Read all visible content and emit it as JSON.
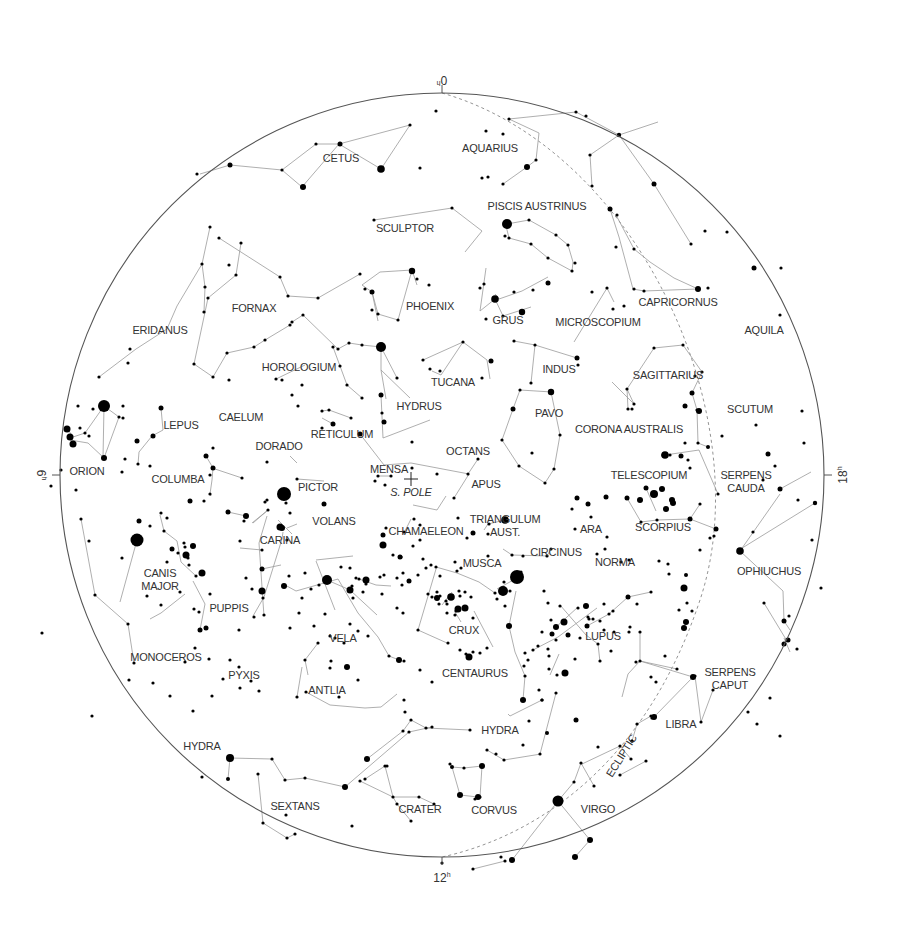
{
  "map": {
    "title": "Southern sky star chart",
    "pole_label": "S. POLE",
    "ecliptic_label": "ECLIPTIC",
    "hour_labels": [
      {
        "name": "hour-0",
        "text": "0",
        "sup": "h",
        "ra": 0
      },
      {
        "name": "hour-6",
        "text": "6",
        "sup": "h",
        "ra": 6
      },
      {
        "name": "hour-12",
        "text": "12",
        "sup": "h",
        "ra": 12
      },
      {
        "name": "hour-18",
        "text": "18",
        "sup": "h",
        "ra": 18
      }
    ],
    "colors": {
      "star": "#000000",
      "lines": "#9a9a9a",
      "text": "#333333",
      "border": "#555555",
      "ecliptic": "#888888"
    },
    "constellations": [
      {
        "name": "CETUS",
        "lines": [
          [
            "CETUS",
            ""
          ]
        ],
        "p": [
          341,
          162
        ]
      },
      {
        "name": "AQUARIUS",
        "lines": [
          [
            "AQUARIUS",
            ""
          ]
        ],
        "p": [
          490,
          152
        ]
      },
      {
        "name": "PISCIS AUSTRINUS",
        "lines": [
          [
            "PISCIS AUSTRINUS",
            ""
          ]
        ],
        "p": [
          537,
          210
        ]
      },
      {
        "name": "SCULPTOR",
        "lines": [
          [
            "SCULPTOR",
            ""
          ]
        ],
        "p": [
          405,
          232
        ]
      },
      {
        "name": "FORNAX",
        "lines": [
          [
            "FORNAX",
            ""
          ]
        ],
        "p": [
          254,
          312
        ]
      },
      {
        "name": "PHOENIX",
        "lines": [
          [
            "PHOENIX",
            ""
          ]
        ],
        "p": [
          430,
          310
        ]
      },
      {
        "name": "GRUS",
        "lines": [
          [
            "GRUS",
            ""
          ]
        ],
        "p": [
          508,
          324
        ]
      },
      {
        "name": "MICROSCOPIUM",
        "lines": [
          [
            "MICROSCOPIUM",
            ""
          ]
        ],
        "p": [
          598,
          326
        ]
      },
      {
        "name": "CAPRICORNUS",
        "lines": [
          [
            "CAPRICORNUS",
            ""
          ]
        ],
        "p": [
          678,
          306
        ]
      },
      {
        "name": "AQUILA",
        "lines": [
          [
            "AQUILA",
            ""
          ]
        ],
        "p": [
          764,
          334
        ]
      },
      {
        "name": "ERIDANUS",
        "lines": [
          [
            "ERIDANUS",
            ""
          ]
        ],
        "p": [
          160,
          334
        ]
      },
      {
        "name": "HOROLOGIUM",
        "lines": [
          [
            "HOROLOGIUM",
            ""
          ]
        ],
        "p": [
          299,
          371
        ]
      },
      {
        "name": "TUCANA",
        "lines": [
          [
            "TUCANA",
            ""
          ]
        ],
        "p": [
          453,
          386
        ]
      },
      {
        "name": "INDUS",
        "lines": [
          [
            "INDUS",
            ""
          ]
        ],
        "p": [
          559,
          373
        ]
      },
      {
        "name": "SAGITTARIUS",
        "lines": [
          [
            "SAGITTARIUS",
            ""
          ]
        ],
        "p": [
          668,
          379
        ]
      },
      {
        "name": "LEPUS",
        "lines": [
          [
            "LEPUS",
            ""
          ]
        ],
        "p": [
          181,
          429
        ]
      },
      {
        "name": "CAELUM",
        "lines": [
          [
            "CAELUM",
            ""
          ]
        ],
        "p": [
          241,
          421
        ]
      },
      {
        "name": "HYDRUS",
        "lines": [
          [
            "HYDRUS",
            ""
          ]
        ],
        "p": [
          419,
          410
        ]
      },
      {
        "name": "PAVO",
        "lines": [
          [
            "PAVO",
            ""
          ]
        ],
        "p": [
          549,
          417
        ]
      },
      {
        "name": "SCUTUM",
        "lines": [
          [
            "SCUTUM",
            ""
          ]
        ],
        "p": [
          750,
          413
        ]
      },
      {
        "name": "DORADO",
        "lines": [
          [
            "DORADO",
            ""
          ]
        ],
        "p": [
          279,
          450
        ]
      },
      {
        "name": "RETICULUM",
        "lines": [
          [
            "RETICULUM",
            ""
          ]
        ],
        "p": [
          342,
          438
        ]
      },
      {
        "name": "CORONA AUSTRALIS",
        "lines": [
          [
            "CORONA AUSTRALIS",
            ""
          ]
        ],
        "p": [
          629,
          433
        ]
      },
      {
        "name": "OCTANS",
        "lines": [
          [
            "OCTANS",
            ""
          ]
        ],
        "p": [
          468,
          455
        ]
      },
      {
        "name": "ORION",
        "lines": [
          [
            "ORION",
            ""
          ]
        ],
        "p": [
          87,
          475
        ]
      },
      {
        "name": "COLUMBA",
        "lines": [
          [
            "COLUMBA",
            ""
          ]
        ],
        "p": [
          178,
          483
        ]
      },
      {
        "name": "MENSA",
        "lines": [
          [
            "MENSA",
            ""
          ]
        ],
        "p": [
          389,
          473
        ]
      },
      {
        "name": "APUS",
        "lines": [
          [
            "APUS",
            ""
          ]
        ],
        "p": [
          486,
          488
        ]
      },
      {
        "name": "TELESCOPIUM",
        "lines": [
          [
            "TELESCOPIUM",
            ""
          ]
        ],
        "p": [
          649,
          479
        ]
      },
      {
        "name": "SERPENS|CAUDA",
        "lines": [
          [
            "SERPENS",
            ""
          ]
        ],
        "p": [
          746,
          479
        ]
      },
      {
        "name": "PICTOR",
        "lines": [
          [
            "PICTOR",
            ""
          ]
        ],
        "p": [
          318,
          491
        ]
      },
      {
        "name": "VOLANS",
        "lines": [
          [
            "VOLANS",
            ""
          ]
        ],
        "p": [
          334,
          525
        ]
      },
      {
        "name": "CHAMAELEON",
        "lines": [
          [
            "CHAMAELEON",
            ""
          ]
        ],
        "p": [
          426,
          535
        ]
      },
      {
        "name": "TRIANGULUM|AUST.",
        "lines": [
          [
            "TRIANGULUM",
            ""
          ]
        ],
        "p": [
          505,
          523
        ]
      },
      {
        "name": "ARA",
        "lines": [
          [
            "ARA",
            ""
          ]
        ],
        "p": [
          591,
          533
        ]
      },
      {
        "name": "SCORPIUS",
        "lines": [
          [
            "SCORPIUS",
            ""
          ]
        ],
        "p": [
          663,
          531
        ]
      },
      {
        "name": "CARINA",
        "lines": [
          [
            "CARINA",
            ""
          ]
        ],
        "p": [
          280,
          544
        ]
      },
      {
        "name": "CIRCINUS",
        "lines": [
          [
            "CIRCINUS",
            ""
          ]
        ],
        "p": [
          556,
          556
        ]
      },
      {
        "name": "NORMA",
        "lines": [
          [
            "NORMA",
            ""
          ]
        ],
        "p": [
          615,
          566
        ]
      },
      {
        "name": "MUSCA",
        "lines": [
          [
            "MUSCA",
            ""
          ]
        ],
        "p": [
          482,
          567
        ]
      },
      {
        "name": "CANIS|MAJOR",
        "lines": [
          [
            "CANIS",
            ""
          ]
        ],
        "p": [
          160,
          577
        ]
      },
      {
        "name": "OPHIUCHUS",
        "lines": [
          [
            "OPHIUCHUS",
            ""
          ]
        ],
        "p": [
          769,
          575
        ]
      },
      {
        "name": "PUPPIS",
        "lines": [
          [
            "PUPPIS",
            ""
          ]
        ],
        "p": [
          229,
          612
        ]
      },
      {
        "name": "CRUX",
        "lines": [
          [
            "CRUX",
            ""
          ]
        ],
        "p": [
          464,
          634
        ]
      },
      {
        "name": "LUPUS",
        "lines": [
          [
            "LUPUS",
            ""
          ]
        ],
        "p": [
          603,
          640
        ]
      },
      {
        "name": "VELA",
        "lines": [
          [
            "VELA",
            ""
          ]
        ],
        "p": [
          343,
          642
        ]
      },
      {
        "name": "MONOCEROS",
        "lines": [
          [
            "MONOCEROS",
            ""
          ]
        ],
        "p": [
          166,
          661
        ]
      },
      {
        "name": "CENTAURUS",
        "lines": [
          [
            "CENTAURUS",
            ""
          ]
        ],
        "p": [
          475,
          677
        ]
      },
      {
        "name": "SERPENS|CAPUT",
        "lines": [
          [
            "SERPENS",
            ""
          ]
        ],
        "p": [
          730,
          676
        ]
      },
      {
        "name": "PYXIS",
        "lines": [
          [
            "PYXIS",
            ""
          ]
        ],
        "p": [
          244,
          679
        ]
      },
      {
        "name": "ANTLIA",
        "lines": [
          [
            "ANTLIA",
            ""
          ]
        ],
        "p": [
          327,
          694
        ]
      },
      {
        "name": "LIBRA",
        "lines": [
          [
            "LIBRA",
            ""
          ]
        ],
        "p": [
          681,
          728
        ]
      },
      {
        "name": "HYDRA",
        "lines": [
          [
            "HYDRA",
            ""
          ]
        ],
        "p": [
          500,
          734
        ]
      },
      {
        "name": "HYDRA",
        "lines": [
          [
            "HYDRA",
            ""
          ]
        ],
        "p": [
          202,
          750
        ]
      },
      {
        "name": "SEXTANS",
        "lines": [
          [
            "SEXTANS",
            ""
          ]
        ],
        "p": [
          295,
          810
        ]
      },
      {
        "name": "CRATER",
        "lines": [
          [
            "CRATER",
            ""
          ]
        ],
        "p": [
          420,
          813
        ]
      },
      {
        "name": "CORVUS",
        "lines": [
          [
            "CORVUS",
            ""
          ]
        ],
        "p": [
          494,
          814
        ]
      },
      {
        "name": "VIRGO",
        "lines": [
          [
            "VIRGO",
            ""
          ]
        ],
        "p": [
          598,
          813
        ]
      }
    ]
  }
}
